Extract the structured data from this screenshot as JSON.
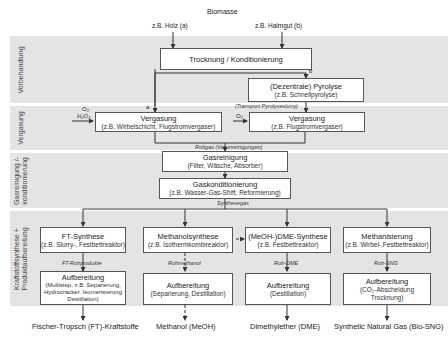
{
  "title": "Biomasse",
  "inputs": {
    "a": "z.B. Holz (a)",
    "b": "z.B. Halmgut (b)"
  },
  "bands": [
    {
      "label": "Vorbehandlung"
    },
    {
      "label": "Vergasung"
    },
    {
      "label": "Gasreinigung /-",
      "label2": "konditionierung"
    },
    {
      "label": "Kraftstoffsynthese +",
      "label2": "Produktaufbereitung"
    }
  ],
  "boxes": {
    "trocknung": {
      "title": "Trocknung / Konditionierung"
    },
    "pyrolyse": {
      "title": "(Dezentrale) Pyrolyse",
      "sub": "(z.B. Schnellpyrolyse)"
    },
    "vergasung_a": {
      "title": "Vergasung",
      "sub": "(z.B. Wirbelschicht, Flugstromvergaser)"
    },
    "vergasung_b": {
      "title": "Vergasung",
      "sub": "(z.B. Flugstromvergaser)"
    },
    "gasreinigung": {
      "title": "Gasreinigung",
      "sub": "(Filter, Wäsche, Absorber)"
    },
    "gaskonditionierung": {
      "title": "Gaskonditionierung",
      "sub": "(z.B. Wasser-Gas-Shift, Reformierung)"
    },
    "ft_synthese": {
      "title": "FT-Synthese",
      "sub": "(z.B. Slurry-, Festbettreaktor)"
    },
    "methanolsynthese": {
      "title": "Methanolsynthese",
      "sub": "(z.B. Isothermkombireaktor)"
    },
    "dme_synthese": {
      "title": "(MeOH-)DME-Synthese",
      "sub": "(z.B. Festbettreaktor)"
    },
    "methanisierung": {
      "title": "Methanisierung",
      "sub": "(z.B. Wirbel-,Festbettreaktor)"
    },
    "aufb_ft": {
      "title": "Aufbereitung",
      "sub": "(Multistep, z.B. Separierung, Hydrocracker, Isomerisierung Destillation)"
    },
    "aufb_meoh": {
      "title": "Aufbereitung",
      "sub": "(Separierung, Destillation)"
    },
    "aufb_dme": {
      "title": "Aufbereitung",
      "sub": "(Destillation)"
    },
    "aufb_sng": {
      "title": "Aufbereitung",
      "sub": "(CO₂-Abscheidung Trocknung)"
    }
  },
  "labels": {
    "branch_a": "a",
    "branch_b": "b",
    "o2_h2o": "O₂",
    "h2o2": "H₂O₂",
    "o2_b": "O₂",
    "transport": "(Transport Pyrolyseslurry)",
    "rohgas": "Rohgas (Verunreinigungen)",
    "synthesegas": "Synthesegas",
    "ft_roh": "FT-Rohprodukte",
    "rohmethanol": "Rohmethanol",
    "roh_dme": "Roh-DME",
    "roh_sng": "Roh-SNG"
  },
  "outputs": [
    "Fischer-Tropsch (FT)-Kraftstoffe",
    "Methanol (MeOH)",
    "Dimethylether (DME)",
    "Synthetic Natural Gas (Bio-SNG)"
  ],
  "colors": {
    "band": "#e4e4e4",
    "line": "#333333",
    "box_border": "#555555"
  }
}
